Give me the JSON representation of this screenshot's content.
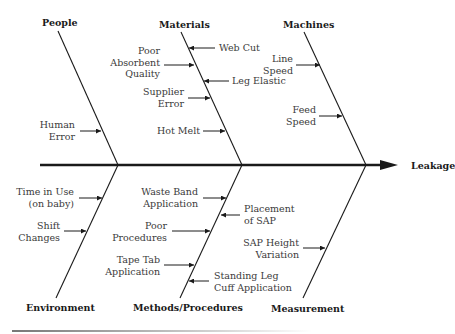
{
  "effect": "Leakage",
  "categories": {
    "people": {
      "label": "People",
      "causes": [
        "Human\nError"
      ]
    },
    "materials": {
      "label": "Materials",
      "causes": [
        "Poor\nAbsorbent\nQuality",
        "Web Cut",
        "Leg Elastic",
        "Supplier\nError",
        "Hot Melt"
      ]
    },
    "machines": {
      "label": "Machines",
      "causes": [
        "Line\nSpeed",
        "Feed\nSpeed"
      ]
    },
    "environment": {
      "label": "Environment",
      "causes": [
        "Time in Use\n(on baby)",
        "Shift\nChanges"
      ]
    },
    "methods": {
      "label": "Methods/Procedures",
      "causes": [
        "Waste Band\nApplication",
        "Placement\nof SAP",
        "Poor\nProcedures",
        "Tape Tab\nApplication",
        "Standing Leg\nCuff Application"
      ]
    },
    "measurement": {
      "label": "Measurement",
      "causes": [
        "SAP Height\nVariation"
      ]
    }
  },
  "colors": {
    "line": "#1a1a1a",
    "text": "#3a3a3a"
  }
}
